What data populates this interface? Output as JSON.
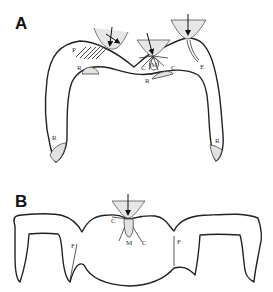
{
  "figure": {
    "panels": [
      {
        "id": "A",
        "label": "A",
        "annotations": {
          "P": "P",
          "R_left_top": "R",
          "R_center": "R",
          "R_left_bottom": "R",
          "R_right_bottom": "R",
          "C_left": "C",
          "M": "M",
          "C_right": "C",
          "E": "E"
        }
      },
      {
        "id": "B",
        "label": "B",
        "annotations": {
          "F_left": "F",
          "C_left": "C",
          "M": "M",
          "C_right": "C",
          "F_right": "F"
        }
      }
    ],
    "colors": {
      "outline": "#222222",
      "shade": "#e2e2e2",
      "background": "#ffffff"
    }
  }
}
